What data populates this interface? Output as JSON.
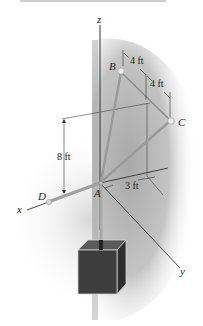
{
  "figure": {
    "labels": {
      "axis_z": "z",
      "axis_x": "x",
      "axis_y": "y",
      "point_A": "A",
      "point_B": "B",
      "point_C": "C",
      "point_D": "D"
    },
    "dimensions": {
      "b_offset": "4 ft",
      "c_offset": "4 ft",
      "height": "8 ft",
      "y_offset": "3 ft"
    },
    "colors": {
      "shade": "#b8b8b8",
      "rod": "#9a9a9a",
      "line": "#333333",
      "block": "#3a3a3a"
    }
  }
}
